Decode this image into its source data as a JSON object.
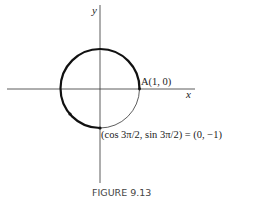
{
  "figure": {
    "caption": "FIGURE 9.13",
    "axes": {
      "x_label": "x",
      "y_label": "y"
    },
    "circle": {
      "type": "unit circle",
      "center": [
        0,
        0
      ],
      "radius": 1
    },
    "highlighted_arc": {
      "from_angle": "0",
      "to_angle": "3π/2",
      "direction": "counterclockwise"
    },
    "points": [
      {
        "label": "A(1, 0)",
        "coords": [
          1,
          0
        ]
      },
      {
        "label": "(cos 3π/2, sin 3π/2) = (0, −1)",
        "coords": [
          0,
          -1
        ]
      }
    ]
  }
}
